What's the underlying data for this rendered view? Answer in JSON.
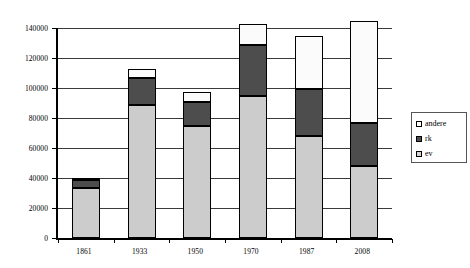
{
  "chart_data": {
    "type": "bar",
    "title": "",
    "subtitle": "",
    "xlabel": "",
    "ylabel": "",
    "stacked": true,
    "grid": true,
    "legend_position": "right",
    "ylim": [
      0,
      140000
    ],
    "ytick_step": 20000,
    "categories": [
      "1861",
      "1933",
      "1950",
      "1970",
      "1987",
      "2008"
    ],
    "ytick_labels": [
      "0",
      "20000",
      "40000",
      "60000",
      "80000",
      "100000",
      "120000",
      "140000"
    ],
    "ytick_values": [
      0,
      20000,
      40000,
      60000,
      80000,
      100000,
      120000,
      140000
    ],
    "series": [
      {
        "name": "ev",
        "color": "#cccccc",
        "values": [
          33500,
          89000,
          75000,
          95000,
          68000,
          48000
        ]
      },
      {
        "name": "rk",
        "color": "#4d4d4d",
        "values": [
          5000,
          18000,
          16000,
          33500,
          31500,
          28500
        ]
      },
      {
        "name": "andere",
        "color": "#fbfbfb",
        "values": [
          1500,
          5500,
          6500,
          14500,
          35000,
          68500
        ]
      }
    ],
    "totals": [
      40000,
      112500,
      97500,
      143000,
      134500,
      145000
    ],
    "cumulative_tops": {
      "ev": [
        33500,
        89000,
        75000,
        95000,
        68000,
        48000
      ],
      "rk": [
        38500,
        107000,
        91000,
        128500,
        99500,
        76500
      ],
      "andere": [
        40000,
        112500,
        97500,
        143000,
        134500,
        145000
      ]
    }
  },
  "legend": {
    "entries": [
      {
        "label": "andere",
        "swatch_color": "#fbfbfb"
      },
      {
        "label": "rk",
        "swatch_color": "#4d4d4d"
      },
      {
        "label": "ev",
        "swatch_color": "#d5d5d5"
      }
    ]
  },
  "axes": {
    "y_tick_labels": [
      "140000",
      "120000",
      "100000",
      "80000",
      "60000",
      "40000",
      "20000",
      "0"
    ],
    "x_tick_labels": [
      "1861",
      "1933",
      "1950",
      "1970",
      "1987",
      "2008"
    ]
  }
}
